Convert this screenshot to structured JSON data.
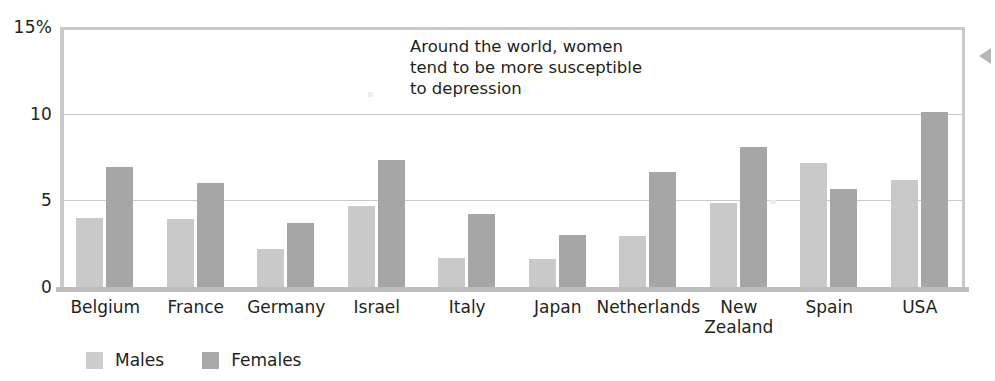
{
  "chart_data": {
    "type": "bar",
    "title": "",
    "subtitle": "",
    "annotation": "Around the world, women\ntend to be more susceptible\nto depression",
    "xlabel": "",
    "ylabel": "",
    "ylim": [
      0,
      15
    ],
    "yticks": [
      0,
      5,
      10,
      15
    ],
    "ytick_labels": [
      "0",
      "5",
      "10",
      "15%"
    ],
    "grid": true,
    "legend_position": "bottom-left",
    "categories": [
      "Belgium",
      "France",
      "Germany",
      "Israel",
      "Italy",
      "Japan",
      "Netherlands",
      "New\nZealand",
      "Spain",
      "USA"
    ],
    "series": [
      {
        "name": "Males",
        "color": "#c9c9c9",
        "values": [
          4.0,
          3.9,
          2.2,
          4.7,
          1.7,
          1.6,
          2.95,
          4.85,
          7.15,
          6.15
        ]
      },
      {
        "name": "Females",
        "color": "#a6a6a6",
        "values": [
          6.9,
          6.0,
          3.7,
          7.3,
          4.2,
          3.0,
          6.65,
          8.1,
          5.65,
          10.1
        ]
      }
    ]
  },
  "axis": {
    "y_labels": [
      "15%",
      "10",
      "5",
      "0"
    ]
  },
  "legend": {
    "items": [
      {
        "label": "Males",
        "swatch": "male-swatch"
      },
      {
        "label": "Females",
        "swatch": "female-swatch"
      }
    ]
  },
  "icons": {
    "edge_arrow": "triangle-left-icon"
  }
}
